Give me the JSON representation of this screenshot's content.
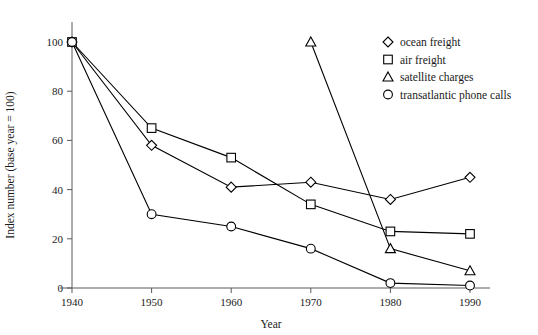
{
  "chart_data": {
    "type": "line",
    "title": "",
    "xlabel": "Year",
    "ylabel": "Index number (base year = 100)",
    "xlim": [
      1940,
      1990
    ],
    "ylim": [
      0,
      100
    ],
    "xticks": [
      1940,
      1950,
      1960,
      1970,
      1980,
      1990
    ],
    "yticks": [
      0,
      20,
      40,
      60,
      80,
      100
    ],
    "grid": false,
    "legend_position": "top-right",
    "x": [
      1940,
      1950,
      1960,
      1970,
      1980,
      1990
    ],
    "series": [
      {
        "name": "ocean freight",
        "marker": "diamond",
        "x": [
          1940,
          1950,
          1960,
          1970,
          1980,
          1990
        ],
        "values": [
          100,
          58,
          41,
          43,
          36,
          45
        ]
      },
      {
        "name": "air freight",
        "marker": "square",
        "x": [
          1940,
          1950,
          1960,
          1970,
          1980,
          1990
        ],
        "values": [
          100,
          65,
          53,
          34,
          23,
          22
        ]
      },
      {
        "name": "satellite charges",
        "marker": "triangle",
        "x": [
          1970,
          1980,
          1990
        ],
        "values": [
          100,
          16,
          7
        ]
      },
      {
        "name": "transatlantic phone calls",
        "marker": "circle",
        "x": [
          1940,
          1950,
          1960,
          1970,
          1980,
          1990
        ],
        "values": [
          100,
          30,
          25,
          16,
          2,
          1
        ]
      }
    ]
  },
  "axes": {
    "y_title": "Index number (base year = 100)",
    "x_title": "Year",
    "y_tick_labels": [
      "0",
      "20",
      "40",
      "60",
      "80",
      "100"
    ],
    "x_tick_labels": [
      "1940",
      "1950",
      "1960",
      "1970",
      "1980",
      "1990"
    ]
  },
  "legend": {
    "items": [
      {
        "label": "ocean freight",
        "marker": "diamond"
      },
      {
        "label": "air freight",
        "marker": "square"
      },
      {
        "label": "satellite charges",
        "marker": "triangle"
      },
      {
        "label": "transatlantic phone calls",
        "marker": "circle"
      }
    ]
  },
  "colors": {
    "line": "#000000",
    "marker_fill": "#ffffff",
    "axis": "#5a5a5a",
    "text": "#1a1a1a",
    "background": "#ffffff"
  }
}
